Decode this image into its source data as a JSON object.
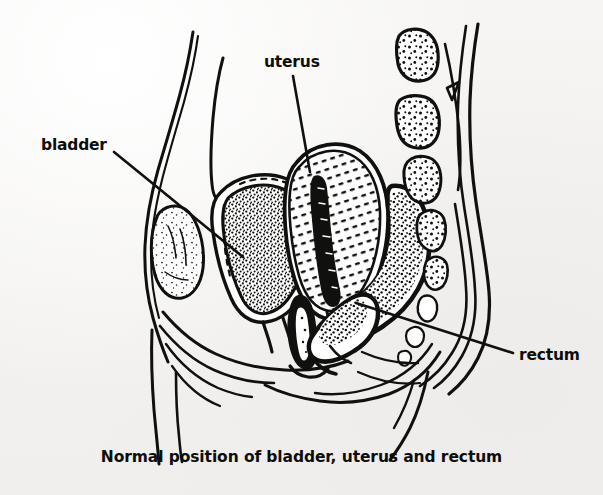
{
  "figure": {
    "type": "anatomical-line-illustration",
    "caption": "Normal position of bladder, uterus and rectum",
    "background_color": "#f4f3f1",
    "ink_color": "#10100e",
    "labels": [
      {
        "id": "bladder",
        "text": "bladder",
        "x": 41,
        "y": 138,
        "leader_from": [
          114,
          152
        ],
        "leader_to": [
          243,
          257
        ]
      },
      {
        "id": "uterus",
        "text": "uterus",
        "x": 264,
        "y": 55,
        "leader_from": [
          293,
          76
        ],
        "leader_to": [
          310,
          172
        ]
      },
      {
        "id": "rectum",
        "text": "rectum",
        "x": 519,
        "y": 348,
        "leader_from": [
          513,
          353
        ],
        "leader_to": [
          356,
          303
        ]
      }
    ],
    "structures": [
      "abdominal-wall",
      "pubic-bone",
      "bladder",
      "urethra",
      "uterus",
      "vagina",
      "rectum",
      "sacrum-vertebrae",
      "coccyx",
      "pelvic-floor",
      "buttock-contour",
      "thigh-contour"
    ]
  }
}
